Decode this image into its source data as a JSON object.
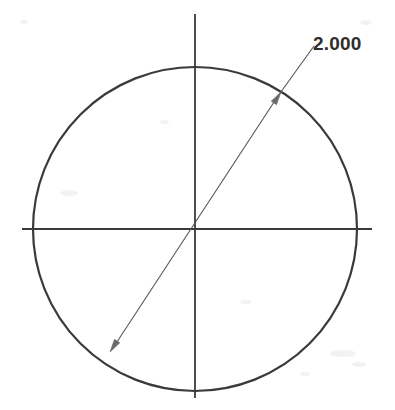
{
  "drawing": {
    "title": "Circle with diameter dimension",
    "background_color": "#ffffff",
    "geometry": {
      "circle": {
        "name": "outer-circle",
        "center_x": 195,
        "center_y": 229,
        "radius": 162,
        "stroke_color": "#3a3a3a",
        "stroke_width": 2.2
      },
      "horizontal_centerline": {
        "name": "horizontal-centerline",
        "x1": 22,
        "y1": 229,
        "x2": 372,
        "y2": 229,
        "stroke_color": "#3a3a3a",
        "stroke_width": 1.8
      },
      "vertical_centerline": {
        "name": "vertical-centerline",
        "x1": 195,
        "y1": 14,
        "x2": 195,
        "y2": 398,
        "stroke_color": "#3a3a3a",
        "stroke_width": 1.8
      },
      "dimension_line": {
        "name": "diameter-dimension-line",
        "x1": 113,
        "y1": 348,
        "x2": 278,
        "y2": 96,
        "stroke_color": "#555555",
        "stroke_width": 1.1
      },
      "leader_line": {
        "name": "dimension-leader-line",
        "x1": 278,
        "y1": 96,
        "x2": 314,
        "y2": 46,
        "stroke_color": "#555555",
        "stroke_width": 1.1
      },
      "arrowhead_upper": {
        "name": "arrowhead-upper-right",
        "tip_x": 281,
        "tip_y": 92,
        "angle_deg": -56.8,
        "length": 13,
        "half_width": 3.2,
        "fill_color": "#6a6a6a"
      },
      "arrowhead_lower": {
        "name": "arrowhead-lower-left",
        "tip_x": 110,
        "tip_y": 352,
        "angle_deg": 123.2,
        "length": 13,
        "half_width": 3.2,
        "fill_color": "#6a6a6a"
      }
    },
    "annotations": [
      {
        "name": "diameter-dimension-label",
        "value": "2.000",
        "x": 313,
        "y": 50,
        "color": "#2e2e2e"
      }
    ]
  },
  "chart_data": {
    "type": "diagram",
    "shapes": [
      {
        "kind": "circle",
        "center": [
          195,
          229
        ],
        "radius_px": 162,
        "diameter_value": "2.000"
      },
      {
        "kind": "centerline",
        "orientation": "horizontal",
        "from": [
          22,
          229
        ],
        "to": [
          372,
          229
        ]
      },
      {
        "kind": "centerline",
        "orientation": "vertical",
        "from": [
          195,
          14
        ],
        "to": [
          195,
          398
        ]
      },
      {
        "kind": "dimension",
        "style": "diameter",
        "from": [
          113,
          348
        ],
        "to": [
          278,
          96
        ],
        "label": "2.000",
        "label_position": [
          313,
          50
        ]
      }
    ],
    "labels": [
      "2.000"
    ]
  },
  "artifacts": [
    {
      "left": 330,
      "top": 350,
      "width": 26,
      "height": 7
    },
    {
      "left": 352,
      "top": 362,
      "width": 14,
      "height": 5
    },
    {
      "left": 300,
      "top": 372,
      "width": 10,
      "height": 4
    },
    {
      "left": 60,
      "top": 190,
      "width": 18,
      "height": 6
    },
    {
      "left": 240,
      "top": 300,
      "width": 12,
      "height": 4
    },
    {
      "left": 160,
      "top": 120,
      "width": 9,
      "height": 4
    },
    {
      "left": 20,
      "top": 20,
      "width": 8,
      "height": 4
    },
    {
      "left": 360,
      "top": 20,
      "width": 12,
      "height": 5
    }
  ]
}
